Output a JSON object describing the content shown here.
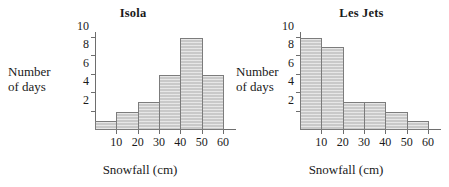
{
  "chart_data": [
    {
      "type": "bar",
      "title": "Isola",
      "xlabel": "Snowfall (cm)",
      "ylabel": "Number of days",
      "ylabel_lines": [
        "Number",
        "of days"
      ],
      "categories": [
        "0-10",
        "10-20",
        "20-30",
        "30-40",
        "40-50",
        "50-60"
      ],
      "bin_edges": [
        0,
        10,
        20,
        30,
        40,
        50,
        60
      ],
      "values": [
        1,
        2,
        3,
        6,
        10,
        6
      ],
      "xticks": [
        10,
        20,
        30,
        40,
        50,
        60
      ],
      "yticks": [
        2,
        4,
        6,
        8,
        10
      ],
      "xlim": [
        0,
        60
      ],
      "ylim": [
        0,
        10
      ],
      "grid": false,
      "legend": false,
      "bar_fill": "#c9c9c9",
      "bar_edge": "#7c7c7c",
      "axis_color": "#6e6e6e"
    },
    {
      "type": "bar",
      "title": "Les Jets",
      "xlabel": "Snowfall (cm)",
      "ylabel": "Number of days",
      "ylabel_lines": [
        "Number",
        "of days"
      ],
      "categories": [
        "0-10",
        "10-20",
        "20-30",
        "30-40",
        "40-50",
        "50-60"
      ],
      "bin_edges": [
        0,
        10,
        20,
        30,
        40,
        50,
        60
      ],
      "values": [
        10,
        9,
        3,
        3,
        2,
        1
      ],
      "xticks": [
        10,
        20,
        30,
        40,
        50,
        60
      ],
      "yticks": [
        2,
        4,
        6,
        8,
        10
      ],
      "xlim": [
        0,
        60
      ],
      "ylim": [
        0,
        10
      ],
      "grid": false,
      "legend": false,
      "bar_fill": "#c9c9c9",
      "bar_edge": "#7c7c7c",
      "axis_color": "#6e6e6e"
    }
  ]
}
